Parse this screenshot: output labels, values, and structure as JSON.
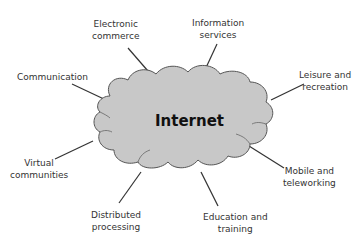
{
  "diagram": {
    "center": {
      "label": "Internet",
      "fill": "#c8c8c8",
      "stroke": "#555555"
    },
    "nodes": [
      {
        "id": "electronic-commerce",
        "line1": "Electronic",
        "line2": "commerce"
      },
      {
        "id": "information-services",
        "line1": "Information",
        "line2": "services"
      },
      {
        "id": "leisure-recreation",
        "line1": "Leisure and",
        "line2": "recreation"
      },
      {
        "id": "communication",
        "line1": "Communication",
        "line2": ""
      },
      {
        "id": "virtual-communities",
        "line1": "Virtual",
        "line2": "communities"
      },
      {
        "id": "mobile-teleworking",
        "line1": "Mobile and",
        "line2": "teleworking"
      },
      {
        "id": "distributed-processing",
        "line1": "Distributed",
        "line2": "processing"
      },
      {
        "id": "education-training",
        "line1": "Education and",
        "line2": "training"
      }
    ]
  }
}
